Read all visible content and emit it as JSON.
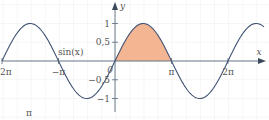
{
  "chart_data": {
    "type": "line",
    "title": "",
    "function": "sin(x)",
    "series": [
      {
        "name": "sin(x)",
        "x_range": [
          -7.4,
          8.9
        ],
        "color": "#3f5273"
      }
    ],
    "shaded_region": {
      "from": 0,
      "to": 3.14159,
      "color": "#f4b593",
      "description": "area under sin(x) from 0 to π"
    },
    "xlabel": "x",
    "ylabel": "y",
    "x_ticks": [
      {
        "value": -6.28318,
        "label": "−2π"
      },
      {
        "value": -3.14159,
        "label": "−π"
      },
      {
        "value": 3.14159,
        "label": "π"
      },
      {
        "value": 6.28318,
        "label": "2π"
      }
    ],
    "y_ticks": [
      {
        "value": 1,
        "label": "1"
      },
      {
        "value": 0.5,
        "label": "0,5"
      },
      {
        "value": -0.5,
        "label": "−0,5"
      },
      {
        "value": -1,
        "label": "−1"
      }
    ],
    "origin_label": "0",
    "curve_label": "sin(x)",
    "footnote": "π",
    "ylim": [
      -1.2,
      1.3
    ],
    "grid": true
  }
}
